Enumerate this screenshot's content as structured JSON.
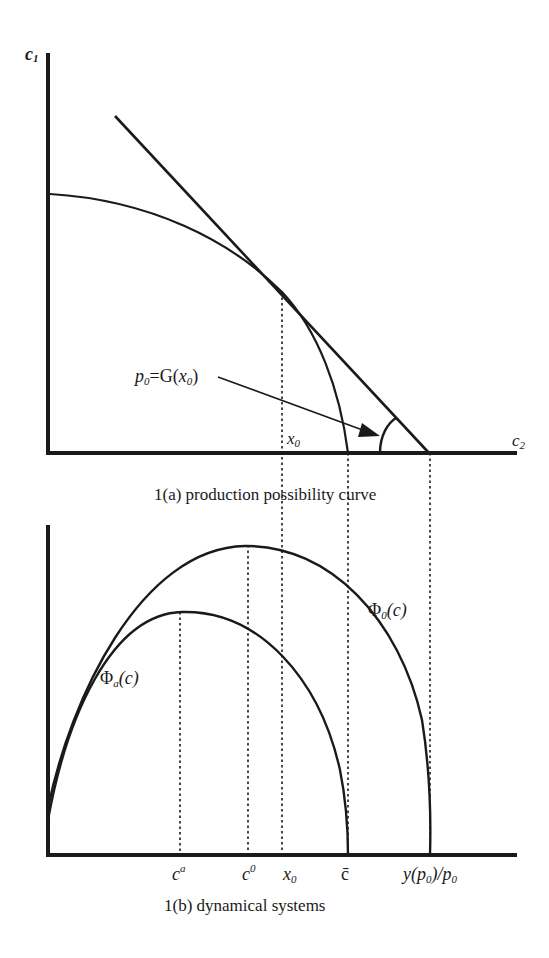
{
  "figure_a": {
    "caption": "1(a)  production possibility curve",
    "y_axis_label": "c",
    "y_axis_sub": "1",
    "x_axis_label": "c",
    "x_axis_sub": "2",
    "annotation": {
      "p": "p",
      "p_sub": "0",
      "eq": "=G(",
      "x": "x",
      "x_sub": "0",
      "close": ")"
    },
    "tick_x0": {
      "label": "x",
      "sub": "0"
    }
  },
  "figure_b": {
    "caption": "1(b)  dynamical systems",
    "curve_o_label": {
      "phi": "Φ",
      "sub": "0",
      "arg": "(c)"
    },
    "curve_a_label": {
      "phi": "Φ",
      "sub": "a",
      "arg": "(c)"
    },
    "ticks": [
      {
        "label": "c",
        "sup": "a"
      },
      {
        "label": "c",
        "sup": "0"
      },
      {
        "label": "x",
        "sub": "0"
      },
      {
        "label": "c̄"
      },
      {
        "label": "y(p",
        "sub": "0",
        "mid": ")/p",
        "sub2": "0"
      }
    ]
  },
  "colors": {
    "ink": "#1a1a1a",
    "background": "#ffffff"
  }
}
